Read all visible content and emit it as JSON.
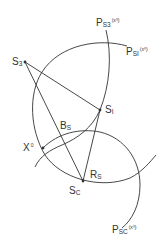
{
  "diagram": {
    "colors": {
      "stroke": "#333333",
      "background": "#ffffff"
    },
    "points": [
      {
        "id": "S3",
        "main": "S",
        "sub": "3",
        "x": 25,
        "y": 62
      },
      {
        "id": "SI",
        "main": "S",
        "sub": "I",
        "x": 100,
        "y": 110
      },
      {
        "id": "SC",
        "main": "S",
        "sub": "C",
        "x": 83,
        "y": 181
      },
      {
        "id": "X0",
        "main": "X",
        "sup": "0",
        "x": 43,
        "y": 148
      }
    ],
    "labels": {
      "s3": {
        "main": "S",
        "sub": "3"
      },
      "si": {
        "main": "S",
        "sub": "I"
      },
      "sc": {
        "main": "S",
        "sub": "C"
      },
      "x0": {
        "main": "X",
        "sup": "0"
      },
      "bs": {
        "main": "B",
        "sub": "S"
      },
      "rs": {
        "main": "R",
        "sub": "S"
      },
      "ps3": {
        "main": "P",
        "sub": "S3",
        "sup": "(x⁰)"
      },
      "psi": {
        "main": "P",
        "sub": "SI",
        "sup": "(x⁰)"
      },
      "psc": {
        "main": "P",
        "sub": "SC",
        "sup": "(x⁰)"
      }
    },
    "curves": [
      "PS3(x0)",
      "PSI(x0)",
      "PSC(x0)"
    ],
    "segments": [
      "S3-SI",
      "S3-SC",
      "SI-SC"
    ]
  }
}
